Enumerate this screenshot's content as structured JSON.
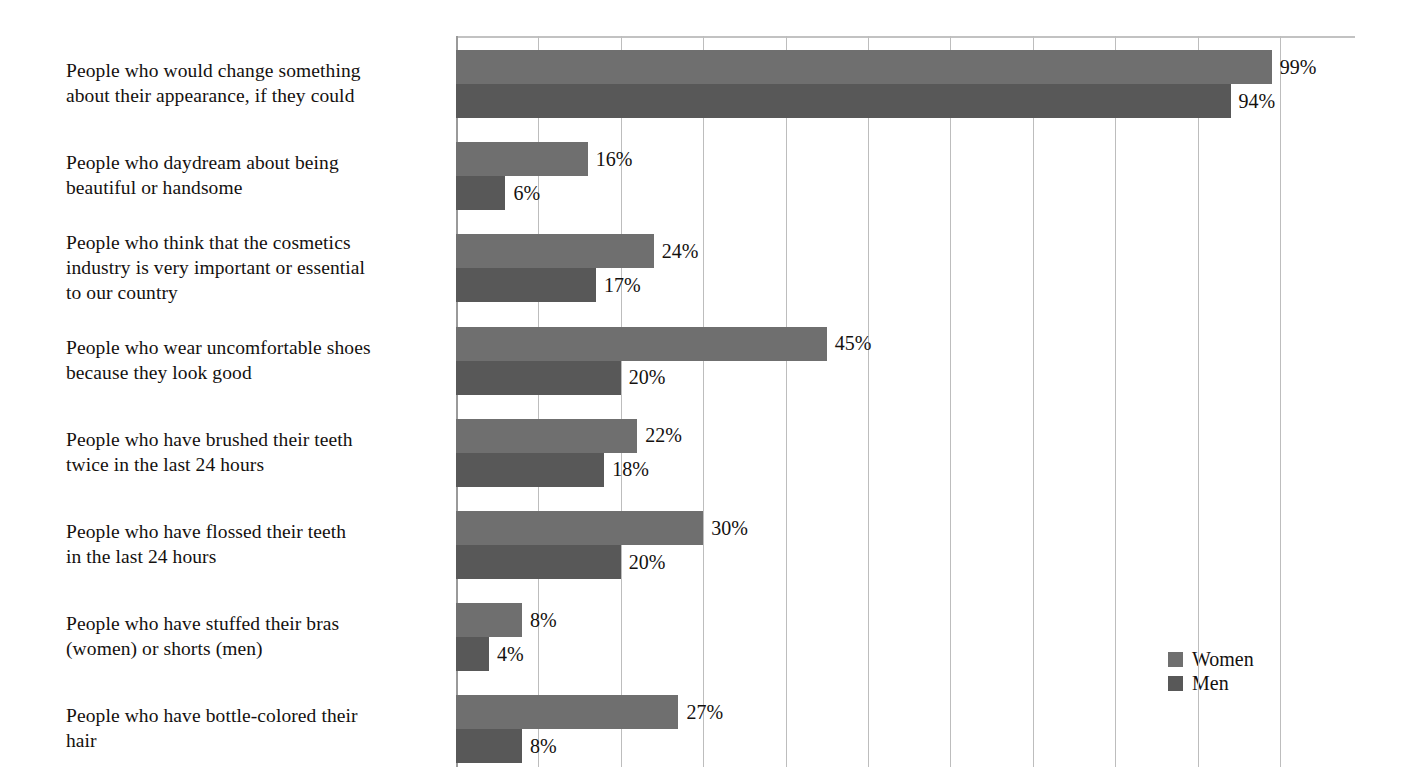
{
  "chart_data": {
    "type": "bar",
    "orientation": "horizontal",
    "title": "",
    "xlabel": "",
    "ylabel": "",
    "xlim": [
      0,
      100
    ],
    "xtick_step": 10,
    "grid": true,
    "legend_position": "right-lower",
    "value_suffix": "%",
    "categories": [
      "People who would change something\nabout their appearance, if they could",
      "People who daydream about being\nbeautiful or handsome",
      "People who think that the cosmetics\nindustry is very important or essential\nto our country",
      "People who wear uncomfortable shoes\nbecause they look good",
      "People who have brushed their teeth\ntwice in the last 24 hours",
      "People who have flossed their teeth\nin the last 24 hours",
      "People who have stuffed their bras\n(women) or shorts (men)",
      "People who have bottle-colored their\nhair"
    ],
    "series": [
      {
        "name": "Women",
        "color": "#6f6f6f",
        "values": [
          99,
          16,
          24,
          45,
          22,
          30,
          8,
          27
        ],
        "labels": [
          "99%",
          "16%",
          "24%",
          "45%",
          "22%",
          "30%",
          "8%",
          "27%"
        ]
      },
      {
        "name": "Men",
        "color": "#585858",
        "values": [
          94,
          6,
          17,
          20,
          18,
          20,
          4,
          8
        ],
        "labels": [
          "94%",
          "6%",
          "17%",
          "20%",
          "18%",
          "20%",
          "4%",
          "8%"
        ]
      }
    ]
  },
  "legend": {
    "items": [
      {
        "label": "Women",
        "color": "#6f6f6f"
      },
      {
        "label": "Men",
        "color": "#585858"
      }
    ]
  }
}
